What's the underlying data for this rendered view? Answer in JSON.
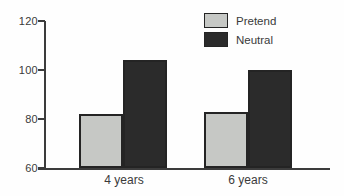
{
  "chart_data": {
    "type": "bar",
    "title": "",
    "xlabel": "",
    "ylabel": "",
    "categories": [
      "4 years",
      "6 years"
    ],
    "series": [
      {
        "name": "Pretend",
        "color": "#c6c8c5",
        "values": [
          82,
          83
        ]
      },
      {
        "name": "Neutral",
        "color": "#2b2b2b",
        "values": [
          104,
          100
        ]
      }
    ],
    "ylim": [
      60,
      120
    ],
    "yticks": [
      60,
      80,
      100,
      120
    ],
    "grid": false,
    "legend_position": "top-right",
    "bar_border_color": "#242424",
    "axis_color": "#3c3c3c"
  }
}
